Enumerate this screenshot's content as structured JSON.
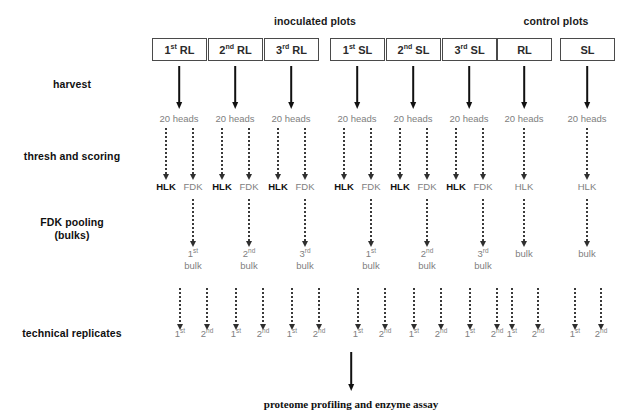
{
  "diagram": {
    "group_headers": [
      {
        "label": "inoculated plots",
        "center_x": 315,
        "y": 15
      },
      {
        "label": "control plots",
        "center_x": 556,
        "y": 15
      }
    ],
    "row_labels": [
      {
        "name": "harvest",
        "lines": [
          "harvest"
        ],
        "center_x": 72,
        "y": 78
      },
      {
        "name": "thresh-and-scoring",
        "lines": [
          "thresh and scoring"
        ],
        "center_x": 72,
        "y": 150
      },
      {
        "name": "fdk-pooling",
        "lines": [
          "FDK pooling",
          "(bulks)"
        ],
        "center_x": 72,
        "y": 216
      },
      {
        "name": "technical-replicates",
        "lines": [
          "technical replicates"
        ],
        "center_x": 72,
        "y": 327
      }
    ],
    "plot_boxes": [
      {
        "id": "rl1",
        "ordinal": "1",
        "suffix": "st",
        "label": "RL",
        "x": 152,
        "width": 55
      },
      {
        "id": "rl2",
        "ordinal": "2",
        "suffix": "nd",
        "label": "RL",
        "x": 208,
        "width": 55
      },
      {
        "id": "rl3",
        "ordinal": "3",
        "suffix": "rd",
        "label": "RL",
        "x": 264,
        "width": 55
      },
      {
        "id": "sl1",
        "ordinal": "1",
        "suffix": "st",
        "label": "SL",
        "x": 330,
        "width": 55
      },
      {
        "id": "sl2",
        "ordinal": "2",
        "suffix": "nd",
        "label": "SL",
        "x": 386,
        "width": 55
      },
      {
        "id": "sl3",
        "ordinal": "3",
        "suffix": "rd",
        "label": "SL",
        "x": 442,
        "width": 55
      },
      {
        "id": "ctrl_rl",
        "ordinal": "",
        "suffix": "",
        "label": "RL",
        "x": 497,
        "width": 55
      },
      {
        "id": "ctrl_sl",
        "ordinal": "",
        "suffix": "",
        "label": "SL",
        "x": 560,
        "width": 55
      }
    ],
    "box_y": 38,
    "columns": [
      {
        "id": "rl1",
        "center_x": 179,
        "inoculated": true,
        "heads_label": "20 heads",
        "fractions": [
          {
            "label": "HLK",
            "style": "dark",
            "offset": -13
          },
          {
            "label": "FDK",
            "style": "gray",
            "offset": 14
          }
        ],
        "bulk_ordinal": "1",
        "bulk_suffix": "st",
        "bulk_label": "bulk",
        "bulk_center_x": 193,
        "replicates": [
          {
            "ordinal": "1",
            "suffix": "st",
            "center_x": 180
          },
          {
            "ordinal": "2",
            "suffix": "nd",
            "center_x": 207
          }
        ]
      },
      {
        "id": "rl2",
        "center_x": 235,
        "inoculated": true,
        "heads_label": "20 heads",
        "fractions": [
          {
            "label": "HLK",
            "style": "dark",
            "offset": -13
          },
          {
            "label": "FDK",
            "style": "gray",
            "offset": 14
          }
        ],
        "bulk_ordinal": "2",
        "bulk_suffix": "nd",
        "bulk_label": "bulk",
        "bulk_center_x": 249,
        "replicates": [
          {
            "ordinal": "1",
            "suffix": "st",
            "center_x": 236
          },
          {
            "ordinal": "2",
            "suffix": "nd",
            "center_x": 263
          }
        ]
      },
      {
        "id": "rl3",
        "center_x": 291,
        "inoculated": true,
        "heads_label": "20 heads",
        "fractions": [
          {
            "label": "HLK",
            "style": "dark",
            "offset": -13
          },
          {
            "label": "FDK",
            "style": "gray",
            "offset": 14
          }
        ],
        "bulk_ordinal": "3",
        "bulk_suffix": "rd",
        "bulk_label": "bulk",
        "bulk_center_x": 305,
        "replicates": [
          {
            "ordinal": "1",
            "suffix": "st",
            "center_x": 292
          },
          {
            "ordinal": "2",
            "suffix": "nd",
            "center_x": 319
          }
        ]
      },
      {
        "id": "sl1",
        "center_x": 357,
        "inoculated": true,
        "heads_label": "20 heads",
        "fractions": [
          {
            "label": "HLK",
            "style": "dark",
            "offset": -13
          },
          {
            "label": "FDK",
            "style": "gray",
            "offset": 14
          }
        ],
        "bulk_ordinal": "1",
        "bulk_suffix": "st",
        "bulk_label": "bulk",
        "bulk_center_x": 371,
        "replicates": [
          {
            "ordinal": "1",
            "suffix": "st",
            "center_x": 358
          },
          {
            "ordinal": "2",
            "suffix": "nd",
            "center_x": 385
          }
        ]
      },
      {
        "id": "sl2",
        "center_x": 413,
        "inoculated": true,
        "heads_label": "20 heads",
        "fractions": [
          {
            "label": "HLK",
            "style": "dark",
            "offset": -13
          },
          {
            "label": "FDK",
            "style": "gray",
            "offset": 14
          }
        ],
        "bulk_ordinal": "2",
        "bulk_suffix": "nd",
        "bulk_label": "bulk",
        "bulk_center_x": 427,
        "replicates": [
          {
            "ordinal": "1",
            "suffix": "st",
            "center_x": 414
          },
          {
            "ordinal": "2",
            "suffix": "nd",
            "center_x": 441
          }
        ]
      },
      {
        "id": "sl3",
        "center_x": 469,
        "inoculated": true,
        "heads_label": "20 heads",
        "fractions": [
          {
            "label": "HLK",
            "style": "dark",
            "offset": -13
          },
          {
            "label": "FDK",
            "style": "gray",
            "offset": 14
          }
        ],
        "bulk_ordinal": "3",
        "bulk_suffix": "rd",
        "bulk_label": "bulk",
        "bulk_center_x": 483,
        "replicates": [
          {
            "ordinal": "1",
            "suffix": "st",
            "center_x": 470
          },
          {
            "ordinal": "2",
            "suffix": "nd",
            "center_x": 497
          }
        ]
      },
      {
        "id": "ctrl_rl",
        "center_x": 524,
        "inoculated": false,
        "heads_label": "20 heads",
        "fractions": [
          {
            "label": "HLK",
            "style": "gray",
            "offset": 0
          }
        ],
        "bulk_ordinal": "",
        "bulk_suffix": "",
        "bulk_label": "bulk",
        "bulk_center_x": 524,
        "replicates": [
          {
            "ordinal": "1",
            "suffix": "st",
            "center_x": 512
          },
          {
            "ordinal": "2",
            "suffix": "nd",
            "center_x": 538
          }
        ]
      },
      {
        "id": "ctrl_sl",
        "center_x": 587,
        "inoculated": false,
        "heads_label": "20 heads",
        "fractions": [
          {
            "label": "HLK",
            "style": "gray",
            "offset": 0
          }
        ],
        "bulk_ordinal": "",
        "bulk_suffix": "",
        "bulk_label": "bulk",
        "bulk_center_x": 587,
        "replicates": [
          {
            "ordinal": "1",
            "suffix": "st",
            "center_x": 575
          },
          {
            "ordinal": "2",
            "suffix": "nd",
            "center_x": 601
          }
        ]
      }
    ],
    "geometry": {
      "harvest_arrow_top": 66,
      "harvest_arrow_height": 36,
      "heads_y": 113,
      "thresh_arrow_top": 128,
      "thresh_arrow_height": 46,
      "fraction_y": 181,
      "pool_arrow_top": 199,
      "pool_arrow_height": 42,
      "bulk_y": 248,
      "replicate_arrow_top": 288,
      "replicate_arrow_height": 36,
      "replicate_y": 328,
      "final_arrow_x": 351,
      "final_arrow_top": 352,
      "final_arrow_height": 32
    },
    "final_step": {
      "label": "proteome profiling and enzyme assay",
      "center_x": 351,
      "y": 398
    },
    "colors": {
      "ink": "#111111",
      "gray_text": "#808080",
      "box_border": "#4a4a4a",
      "background": "#ffffff"
    }
  }
}
